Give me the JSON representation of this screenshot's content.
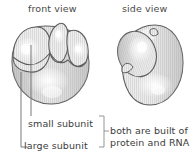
{
  "figure": {
    "background_color": "#ffffff",
    "ink_color": "#3c3c3c",
    "outline_color": "#5a5a5a",
    "fill_light": "#f2f2f2",
    "fill_mid": "#dcdcdc",
    "fill_shadow": "#bdbdbd"
  },
  "views": {
    "front": {
      "title": "front view"
    },
    "side": {
      "title": "side view"
    }
  },
  "callouts": [
    {
      "id": "small-subunit",
      "label": "small subunit"
    },
    {
      "id": "large-subunit",
      "label": "large subunit"
    }
  ],
  "note": {
    "line1": "both are built of",
    "line2": "protein and RNA"
  }
}
